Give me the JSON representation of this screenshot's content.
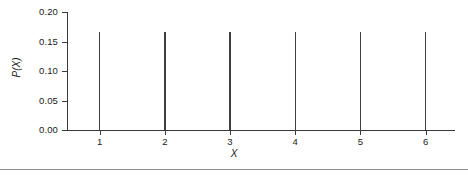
{
  "chart_data": {
    "type": "bar",
    "title": "",
    "subtitle": "",
    "xlabel": "X",
    "ylabel": "P(X)",
    "categories": [
      "1",
      "2",
      "3",
      "4",
      "5",
      "6"
    ],
    "x": [
      1,
      2,
      3,
      4,
      5,
      6
    ],
    "values": [
      0.1667,
      0.1667,
      0.1667,
      0.1667,
      0.1667,
      0.1667
    ],
    "series": [
      {
        "name": "P(X)",
        "values": [
          0.1667,
          0.1667,
          0.1667,
          0.1667,
          0.1667,
          0.1667
        ]
      }
    ],
    "xlim": [
      0.5,
      6.45
    ],
    "ylim": [
      0.0,
      0.2
    ],
    "ytick_labels": [
      "0.00",
      "0.05",
      "0.10",
      "0.15",
      "0.20"
    ],
    "ytick_values": [
      0.0,
      0.05,
      0.1,
      0.15,
      0.2
    ],
    "xtick_labels": [
      "1",
      "2",
      "3",
      "4",
      "5",
      "6"
    ],
    "grid": false,
    "legend": false,
    "legend_position": "none",
    "annotations": [],
    "bar_style": "spike",
    "colors": {
      "bar": "#3f3f3f",
      "axis": "#3a3a3a",
      "text": "#1a1a1a",
      "background": "#ffffff",
      "rule": "#8e8e8e"
    }
  }
}
